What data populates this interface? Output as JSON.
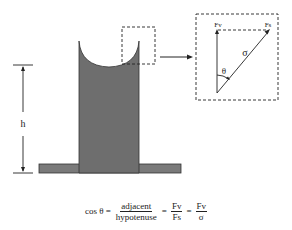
{
  "diagram": {
    "height_label": "h",
    "zoom_box": {
      "vertical_force_label": "Fv",
      "surface_force_label": "Fs",
      "tension_label": "σ",
      "angle_label": "θ"
    },
    "colors": {
      "fluid_fill": "#6e6e6e",
      "plate_fill": "#7a7a7a",
      "line": "#222222",
      "background": "#ffffff"
    }
  },
  "formula": {
    "lhs": "cos θ =",
    "frac1_num": "adjacent",
    "frac1_den": "hypotenuse",
    "eq1": "=",
    "frac2_num": "Fv",
    "frac2_den": "Fs",
    "eq2": "=",
    "frac3_num": "Fv",
    "frac3_den": "σ"
  }
}
